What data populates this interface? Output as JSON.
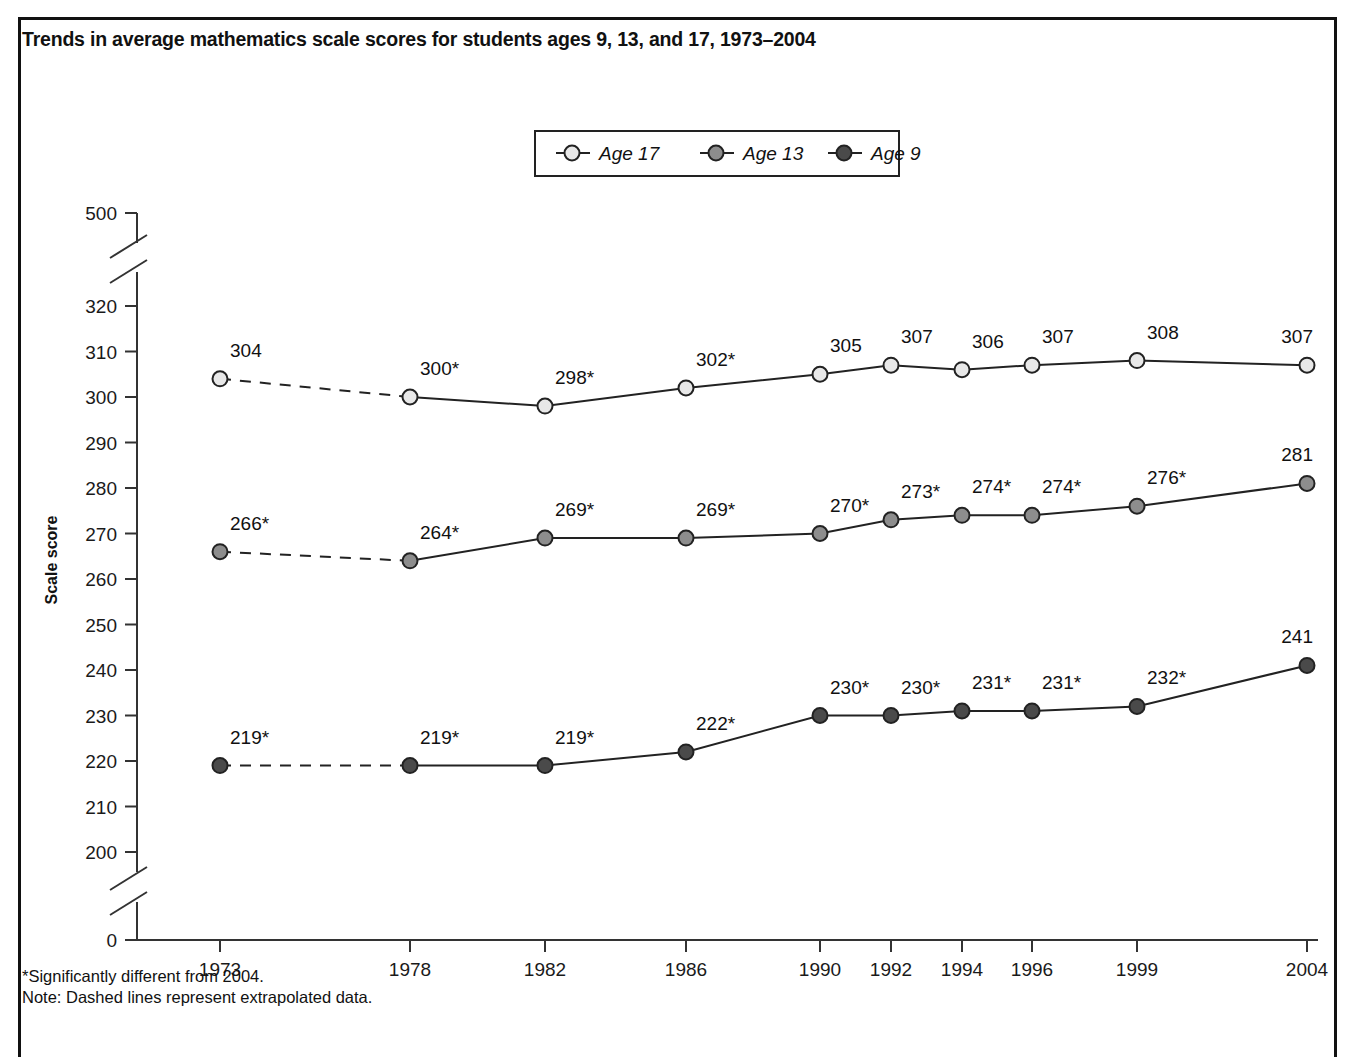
{
  "title": "Trends in average mathematics scale scores for students ages 9, 13, and 17, 1973–2004",
  "axis": {
    "y_title": "Scale score",
    "y_ticks": [
      "500",
      "320",
      "310",
      "300",
      "290",
      "280",
      "270",
      "260",
      "250",
      "240",
      "230",
      "220",
      "210",
      "200",
      "0"
    ],
    "x_ticks": [
      "1973",
      "1978",
      "1982",
      "1986",
      "1990",
      "1992",
      "1994",
      "1996",
      "1999",
      "2004"
    ]
  },
  "legend": {
    "items": [
      {
        "label": "Age 17",
        "marker": "open-circle-icon",
        "color": "#e8e8e8"
      },
      {
        "label": "Age 13",
        "marker": "gray-circle-icon",
        "color": "#8d8d8d"
      },
      {
        "label": "Age 9",
        "marker": "dark-circle-icon",
        "color": "#4a4a4a"
      }
    ]
  },
  "footnotes": [
    "*Significantly different from 2004.",
    "Note: Dashed lines represent extrapolated data."
  ],
  "chart_data": {
    "type": "line",
    "title": "Trends in average mathematics scale scores for students ages 9, 13, and 17, 1973–2004",
    "xlabel": "",
    "ylabel": "Scale score",
    "categories": [
      "1973",
      "1978",
      "1982",
      "1986",
      "1990",
      "1992",
      "1994",
      "1996",
      "1999",
      "2004"
    ],
    "ylim": [
      200,
      320
    ],
    "y_ticks": [
      200,
      210,
      220,
      230,
      240,
      250,
      260,
      270,
      280,
      290,
      300,
      310,
      320
    ],
    "axis_breaks": [
      "between 320 and 500",
      "between 200 and 0"
    ],
    "grid": false,
    "legend_position": "top-center",
    "series": [
      {
        "name": "Age 17",
        "color": "#e8e8e8",
        "values": [
          304,
          300,
          298,
          302,
          305,
          307,
          306,
          307,
          308,
          307
        ],
        "labels": [
          "304",
          "300*",
          "298*",
          "302*",
          "305",
          "307",
          "306",
          "307",
          "308",
          "307"
        ],
        "significant_difference_from_2004": [
          false,
          true,
          true,
          true,
          false,
          false,
          false,
          false,
          false,
          false
        ],
        "extrapolated_segments": [
          "1973-1978"
        ]
      },
      {
        "name": "Age 13",
        "color": "#8d8d8d",
        "values": [
          266,
          264,
          269,
          269,
          270,
          273,
          274,
          274,
          276,
          281
        ],
        "labels": [
          "266*",
          "264*",
          "269*",
          "269*",
          "270*",
          "273*",
          "274*",
          "274*",
          "276*",
          "281"
        ],
        "significant_difference_from_2004": [
          true,
          true,
          true,
          true,
          true,
          true,
          true,
          true,
          true,
          false
        ],
        "extrapolated_segments": [
          "1973-1978"
        ]
      },
      {
        "name": "Age 9",
        "color": "#4a4a4a",
        "values": [
          219,
          219,
          219,
          222,
          230,
          230,
          231,
          231,
          232,
          241
        ],
        "labels": [
          "219*",
          "219*",
          "219*",
          "222*",
          "230*",
          "230*",
          "231*",
          "231*",
          "232*",
          "241"
        ],
        "significant_difference_from_2004": [
          true,
          true,
          true,
          true,
          true,
          true,
          true,
          true,
          true,
          false
        ],
        "extrapolated_segments": [
          "1973-1978"
        ]
      }
    ],
    "notes": [
      "*Significantly different from 2004.",
      "Note: Dashed lines represent extrapolated data."
    ]
  }
}
